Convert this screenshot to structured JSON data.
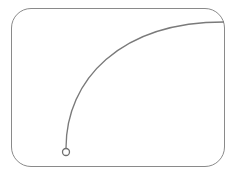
{
  "drawing": {
    "frame": {
      "stroke": "#8a8a8a",
      "radius": 20
    },
    "curve": {
      "stroke": "#7a7a7a",
      "shape": "quarter-arc"
    },
    "endpoint": {
      "shape": "circle",
      "stroke": "#6f6f6f"
    }
  }
}
